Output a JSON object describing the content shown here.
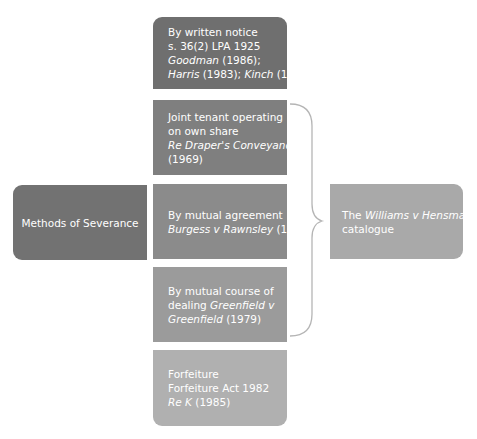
{
  "diagram": {
    "central": {
      "label": "Methods of Severance"
    },
    "methods": [
      {
        "lines": [
          [
            {
              "text": "By written notice",
              "italic": false
            }
          ],
          [
            {
              "text": "s. 36(2) LPA 1925",
              "italic": false
            }
          ],
          [
            {
              "text": "Goodman",
              "italic": true
            },
            {
              "text": " (1986);",
              "italic": false
            }
          ],
          [
            {
              "text": "Harris",
              "italic": true
            },
            {
              "text": " (1983); ",
              "italic": false
            },
            {
              "text": "Kinch",
              "italic": true
            },
            {
              "text": " (1999)",
              "italic": false
            }
          ]
        ]
      },
      {
        "lines": [
          [
            {
              "text": "Joint tenant operating",
              "italic": false
            }
          ],
          [
            {
              "text": "on own share",
              "italic": false
            }
          ],
          [
            {
              "text": "Re Draper's Conveyance",
              "italic": true
            }
          ],
          [
            {
              "text": "(1969)",
              "italic": false
            }
          ]
        ]
      },
      {
        "lines": [
          [
            {
              "text": "By mutual agreement",
              "italic": false
            }
          ],
          [
            {
              "text": "Burgess v Rawnsley",
              "italic": true
            },
            {
              "text": " (1975)",
              "italic": false
            }
          ]
        ]
      },
      {
        "lines": [
          [
            {
              "text": "By mutual course of",
              "italic": false
            }
          ],
          [
            {
              "text": "dealing ",
              "italic": false
            },
            {
              "text": "Greenfield v",
              "italic": true
            }
          ],
          [
            {
              "text": "Greenfield",
              "italic": true
            },
            {
              "text": " (1979)",
              "italic": false
            }
          ]
        ]
      },
      {
        "lines": [
          [
            {
              "text": "Forfeiture",
              "italic": false
            }
          ],
          [
            {
              "text": "Forfeiture Act 1982",
              "italic": false
            }
          ],
          [
            {
              "text": "Re K",
              "italic": true
            },
            {
              "text": " (1985)",
              "italic": false
            }
          ]
        ]
      }
    ],
    "grouping": {
      "brace_covers": [
        1,
        2,
        3
      ],
      "label_lines": [
        [
          {
            "text": "The ",
            "italic": false
          },
          {
            "text": "Williams v Hensman",
            "italic": true
          }
        ],
        [
          {
            "text": "catalogue",
            "italic": false
          }
        ]
      ]
    },
    "colors": {
      "box1": "#6f6f6f",
      "box2": "#7f7f7f",
      "box3": "#8b8b8b",
      "box4": "#9b9b9b",
      "box5": "#b0b0b0",
      "central": "#727272",
      "catalogue": "#a9a9a9",
      "brace": "#b5b5b5"
    }
  }
}
